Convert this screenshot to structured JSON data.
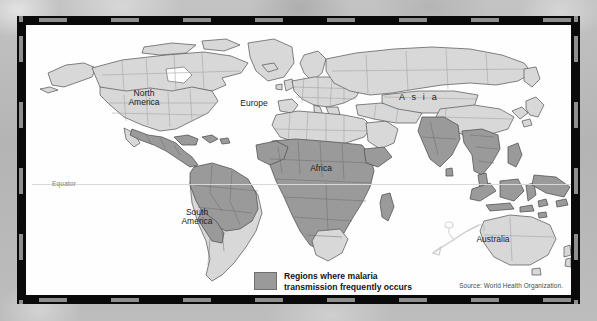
{
  "figure": {
    "type": "thematic-world-map"
  },
  "map": {
    "equator_label": "Equator",
    "region_labels": [
      {
        "id": "north-america",
        "text": "North\nAmerica",
        "x": 118,
        "y": 70
      },
      {
        "id": "south-america",
        "text": "South\nAmerica",
        "x": 170,
        "y": 188
      },
      {
        "id": "europe",
        "text": "Europe",
        "x": 228,
        "y": 78
      },
      {
        "id": "africa",
        "text": "Africa",
        "x": 295,
        "y": 143
      },
      {
        "id": "asia",
        "text": "A s i a",
        "x": 393,
        "y": 73
      },
      {
        "id": "australia",
        "text": "Australia",
        "x": 467,
        "y": 214
      }
    ],
    "colors": {
      "malaria_region": "#9a9a9a",
      "non_malaria_land": "#d8d8d8",
      "land_outline": "#575757",
      "country_border": "#8e8e8e",
      "ocean": "#fefefe",
      "frame": "#0a0a0a",
      "frame_dash": "#8f8f8f",
      "backdrop": "#b9b9b9",
      "equator_line": "#d8d8d8"
    }
  },
  "legend": {
    "swatch_color": "#9a9a9a",
    "text": "Regions where malaria\ntransmission frequently occurs"
  },
  "source": {
    "text": "Source: World Health Organization."
  }
}
